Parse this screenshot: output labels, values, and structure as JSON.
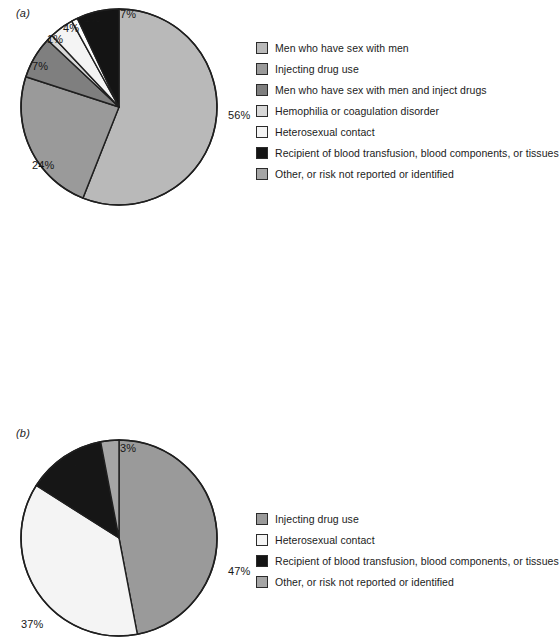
{
  "figure": {
    "background": "#ffffff",
    "panels": [
      {
        "id": "a",
        "label": "(a)"
      },
      {
        "id": "b",
        "label": "(b)"
      }
    ]
  },
  "colors": {
    "slice_light_gray": "#b9b9b9",
    "slice_medium_gray": "#9a9a9a",
    "slice_dark_gray": "#8a8a8a",
    "slice_pale": "#e9e9e9",
    "slice_white": "#fbfbfb",
    "slice_black": "#111111",
    "slice_gray_other": "#a5a5a5",
    "outline": "#1f1f1f",
    "text": "#1b1b1b"
  },
  "legend_a": {
    "items": [
      {
        "label": "Men who have sex with men",
        "color": "#b9b9b9"
      },
      {
        "label": "Injecting drug use",
        "color": "#9a9a9a"
      },
      {
        "label": "Men who have sex with men and inject drugs",
        "color": "#7f7f7f"
      },
      {
        "label": "Hemophilia or coagulation disorder",
        "color": "#d8d8d8"
      },
      {
        "label": "Heterosexual contact",
        "color": "#f4f4f4"
      },
      {
        "label": "Recipient of blood transfusion, blood components, or tissues",
        "color": "#141414"
      },
      {
        "label": "Other, or risk not reported or identified",
        "color": "#a5a5a5"
      }
    ]
  },
  "legend_b": {
    "items": [
      {
        "label": "Injecting drug use",
        "color": "#9a9a9a"
      },
      {
        "label": "Heterosexual contact",
        "color": "#f4f4f4"
      },
      {
        "label": "Recipient of blood transfusion, blood components, or tissues",
        "color": "#141414"
      },
      {
        "label": "Other, or risk not reported or identified",
        "color": "#a5a5a5"
      }
    ]
  },
  "chart_data": [
    {
      "type": "pie",
      "id": "a",
      "title": "(a)",
      "xlabel": "",
      "ylabel": "",
      "legend_position": "right",
      "grid": false,
      "start_angle_deg": 0,
      "direction": "clockwise",
      "categories": [
        "Men who have sex with men",
        "Injecting drug use",
        "Men who have sex with men and inject drugs",
        "Hemophilia or coagulation disorder",
        "Heterosexual contact",
        "Recipient of blood transfusion, blood components, or tissues",
        "Other, or risk not reported or identified"
      ],
      "values": [
        56,
        24,
        7,
        1,
        4,
        1,
        7
      ],
      "data_labels": [
        "56%",
        "24%",
        "7%",
        "1%",
        "4%",
        "1%",
        "7%"
      ],
      "slice_colors": [
        "#b9b9b9",
        "#9a9a9a",
        "#7f7f7f",
        "#d8d8d8",
        "#f4f4f4",
        "#fdfdfd",
        "#141414"
      ]
    },
    {
      "type": "pie",
      "id": "b",
      "title": "(b)",
      "xlabel": "",
      "ylabel": "",
      "legend_position": "right",
      "grid": false,
      "start_angle_deg": 0,
      "direction": "clockwise",
      "categories": [
        "Injecting drug use",
        "Heterosexual contact",
        "Recipient of blood transfusion, blood components, or tissues",
        "Other, or risk not reported or identified"
      ],
      "values": [
        47,
        37,
        13,
        3
      ],
      "data_labels": [
        "47%",
        "37%",
        "13%",
        "3%"
      ],
      "slice_colors": [
        "#9a9a9a",
        "#f4f4f4",
        "#161616",
        "#a5a5a5"
      ]
    }
  ],
  "pie_a_labels": [
    {
      "text": "56%",
      "left": 212,
      "top": 103
    },
    {
      "text": "24%",
      "left": 16,
      "top": 153
    },
    {
      "text": "7%",
      "left": 16,
      "top": 54
    },
    {
      "text": "1%",
      "left": 31,
      "top": 27
    },
    {
      "text": "4%",
      "left": 47,
      "top": 16
    },
    {
      "text": "1%",
      "left": 68,
      "top": 6
    },
    {
      "text": "7%",
      "left": 104,
      "top": 2
    }
  ],
  "pie_b_labels": [
    {
      "text": "47%",
      "left": 212,
      "top": 127
    },
    {
      "text": "37%",
      "left": 5,
      "top": 180
    },
    {
      "text": "13%",
      "left": 50,
      "top": 22
    },
    {
      "text": "3%",
      "left": 104,
      "top": 4
    }
  ]
}
